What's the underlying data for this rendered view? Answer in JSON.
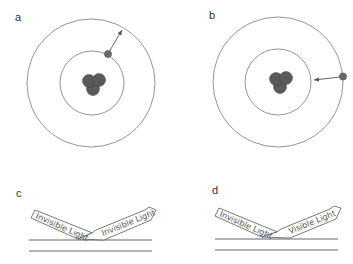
{
  "panels": {
    "a": {
      "label": "a",
      "description": "Electron moves from inner orbit to outer orbit (absorption)",
      "electron_direction": "outward"
    },
    "b": {
      "label": "b",
      "description": "Electron moves from outer orbit to inner orbit (emission)",
      "electron_direction": "inward"
    },
    "c": {
      "label": "c",
      "incoming_beam": "Invisible Light",
      "outgoing_beam": "Invisible Light"
    },
    "d": {
      "label": "d",
      "incoming_beam": "Invisible Light",
      "outgoing_beam": "Visible Light"
    }
  },
  "colors": {
    "orbit": "#777777",
    "nucleus": "#555555",
    "electron": "#666666",
    "text": "#444444",
    "surface": "#555555"
  }
}
